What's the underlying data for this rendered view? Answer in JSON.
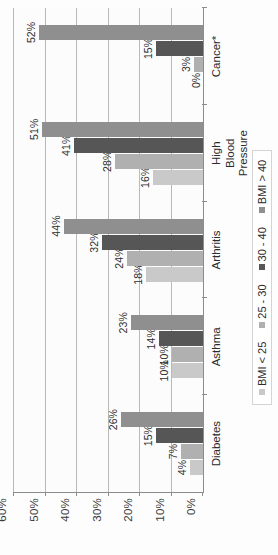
{
  "chart_data": {
    "type": "bar",
    "title": "",
    "xlabel": "",
    "ylabel": "",
    "ylim": [
      0,
      60
    ],
    "grid": true,
    "legend_position": "bottom",
    "orientation": "vertical-grouped",
    "page_rotation": "-90deg",
    "categories": [
      "Diabetes",
      "Asthma",
      "Arthritis",
      "High Blood\nPressure",
      "Cancer*"
    ],
    "series": [
      {
        "name": "BMI < 25",
        "color": "#c9c9c9",
        "values": [
          4,
          10,
          18,
          16,
          0
        ],
        "labels": [
          "4%",
          "10%",
          "18%",
          "16%",
          "0%"
        ]
      },
      {
        "name": "25 - 30",
        "color": "#b0b0b0",
        "values": [
          7,
          10,
          24,
          28,
          3
        ],
        "labels": [
          "7%",
          "10%",
          "24%",
          "28%",
          "3%"
        ]
      },
      {
        "name": "30 - 40",
        "color": "#565656",
        "values": [
          15,
          14,
          32,
          41,
          15
        ],
        "labels": [
          "15%",
          "14%",
          "32%",
          "41%",
          "15%"
        ]
      },
      {
        "name": "BMI > 40",
        "color": "#8f8f8f",
        "values": [
          26,
          23,
          44,
          51,
          52
        ],
        "labels": [
          "26%",
          "23%",
          "44%",
          "51%",
          "52%"
        ]
      }
    ],
    "yticks": [
      {
        "value": 0,
        "label": "0%"
      },
      {
        "value": 10,
        "label": "10%"
      },
      {
        "value": 20,
        "label": "20%"
      },
      {
        "value": 30,
        "label": "30%"
      },
      {
        "value": 40,
        "label": "40%"
      },
      {
        "value": 50,
        "label": "50%"
      },
      {
        "value": 60,
        "label": "60%"
      }
    ]
  }
}
